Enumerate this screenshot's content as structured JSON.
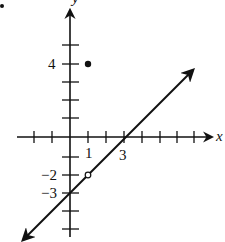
{
  "figure": {
    "type": "coordinate-graph",
    "axes": {
      "x_label": "x",
      "y_label": "y",
      "x_tick_labels": [
        "1",
        "3"
      ],
      "y_tick_labels": [
        "4",
        "−2",
        "−3"
      ]
    },
    "line": {
      "equation": "y = x - 3",
      "slope": 1,
      "y_intercept": -3,
      "x_intercept": 3,
      "arrows": "both"
    },
    "open_point": {
      "x": 1,
      "y": -2,
      "label": "hole"
    },
    "filled_point": {
      "x": 1,
      "y": 4
    },
    "bullet": "•"
  },
  "colors": {
    "ink": "#111111",
    "background": "#ffffff"
  }
}
